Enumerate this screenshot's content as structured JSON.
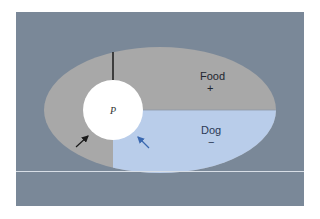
{
  "diagram": {
    "type": "life-space field diagram",
    "colors": {
      "background": "#7a8898",
      "region_positive": "#a8a8a8",
      "region_negative": "#b9cdea",
      "person": "#ffffff",
      "arrow_black": "#1a1a1a",
      "arrow_blue": "#3a68b0",
      "baseline": "#d8dee6"
    },
    "person": {
      "label": "P"
    },
    "regions": [
      {
        "label": "Food",
        "valence": "+"
      },
      {
        "label": "Dog",
        "valence": "−"
      }
    ],
    "arrows": [
      {
        "name": "force-toward-food",
        "color": "black"
      },
      {
        "name": "force-away-from-dog",
        "color": "blue"
      }
    ]
  }
}
